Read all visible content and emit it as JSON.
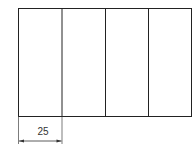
{
  "diagram": {
    "type": "rectangle divided into equal vertical panels",
    "panel_count": 4,
    "dimension": {
      "label": "25",
      "applies_to": "width of first panel"
    },
    "colors": {
      "stroke": "#222222",
      "background": "#ffffff"
    }
  }
}
